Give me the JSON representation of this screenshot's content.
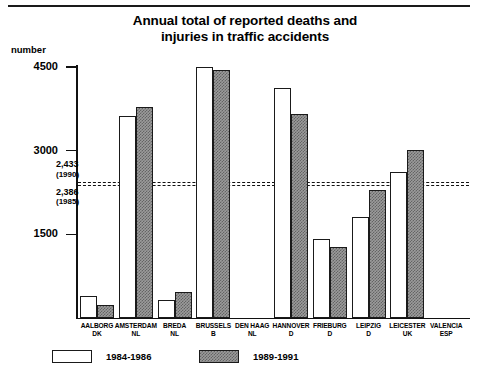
{
  "chart_data": {
    "type": "bar",
    "title": "Annual total of reported deaths and injuries in traffic accidents",
    "title_line1": "Annual total of reported deaths and",
    "title_line2": "injuries in traffic accidents",
    "ylabel": "number",
    "xlabel": "",
    "ylim": [
      0,
      4800
    ],
    "yticks": [
      1500,
      3000,
      4500
    ],
    "ytick_labels": [
      "1500",
      "3000",
      "4500"
    ],
    "grid": false,
    "legend_position": "bottom-left",
    "categories": [
      "AALBORG DK",
      "AMSTERDAM NL",
      "BREDA NL",
      "BRUSSELS B",
      "DEN HAAG NL",
      "HANNOVER D",
      "FRIEBURG D",
      "LEIPZIG D",
      "LEICESTER UK",
      "VALENCIA ESP"
    ],
    "category_parts": [
      {
        "city": "AALBORG",
        "country": "DK"
      },
      {
        "city": "AMSTERDAM",
        "country": "NL"
      },
      {
        "city": "BREDA",
        "country": "NL"
      },
      {
        "city": "BRUSSELS",
        "country": "B"
      },
      {
        "city": "DEN HAAG",
        "country": "NL"
      },
      {
        "city": "HANNOVER",
        "country": "D"
      },
      {
        "city": "FRIEBURG",
        "country": "D"
      },
      {
        "city": "LEIPZIG",
        "country": "D"
      },
      {
        "city": "LEICESTER",
        "country": "UK"
      },
      {
        "city": "VALENCIA",
        "country": "ESP"
      }
    ],
    "series": [
      {
        "name": "1984-1986",
        "fill": "white",
        "values": [
          400,
          3620,
          330,
          4500,
          null,
          4130,
          1420,
          1820,
          2620,
          null
        ]
      },
      {
        "name": "1989-1991",
        "fill": "gray-hatched",
        "values": [
          230,
          3780,
          470,
          4450,
          null,
          3650,
          1270,
          2300,
          3010,
          null
        ]
      }
    ],
    "reference_lines": [
      {
        "value": 2433,
        "label": "2,433",
        "year": "(1990)",
        "style": "dashed"
      },
      {
        "value": 2386,
        "label": "2,386",
        "year": "(1985)",
        "style": "dashed"
      }
    ]
  },
  "colors": {
    "series1": "#ffffff",
    "series2": "#9b9b9b",
    "axis": "#111111",
    "text": "#000000",
    "background": "#ffffff"
  }
}
